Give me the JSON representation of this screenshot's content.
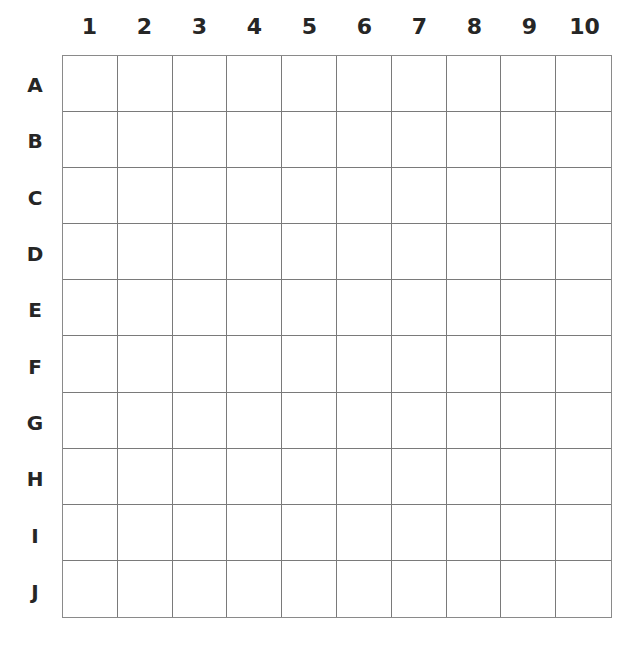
{
  "board": {
    "columns": [
      "1",
      "2",
      "3",
      "4",
      "5",
      "6",
      "7",
      "8",
      "9",
      "10"
    ],
    "rows": [
      "A",
      "B",
      "C",
      "D",
      "E",
      "F",
      "G",
      "H",
      "I",
      "J"
    ]
  }
}
